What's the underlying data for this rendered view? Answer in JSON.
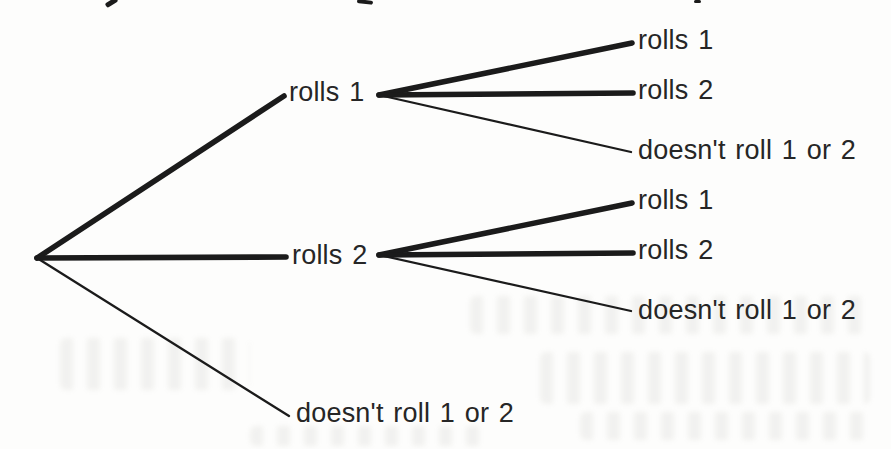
{
  "page": {
    "width": 891,
    "height": 449,
    "background": "#fdfdfc",
    "kind": "scanned textbook probability tree diagram"
  },
  "diagram": {
    "type": "tree",
    "line_color": "#1b1b1b",
    "text_color": "#262626",
    "thick_width": 5.6,
    "thin_width": 2.3,
    "root": {
      "x": 37,
      "y": 258
    },
    "stage1_outcomes": [
      "rolls 1",
      "rolls 2",
      "doesn't roll 1 or 2"
    ],
    "stage2_outcomes": [
      "rolls 1",
      "rolls 2",
      "doesn't roll 1 or 2"
    ],
    "labels": [
      {
        "text": "rolls 1",
        "x": 289,
        "y": 94
      },
      {
        "text": "rolls 2",
        "x": 292,
        "y": 257
      },
      {
        "text": "doesn't roll 1 or 2",
        "x": 296,
        "y": 415
      },
      {
        "text": "rolls 1",
        "x": 638,
        "y": 42
      },
      {
        "text": "rolls 2",
        "x": 638,
        "y": 92
      },
      {
        "text": "doesn't roll 1 or 2",
        "x": 638,
        "y": 152
      },
      {
        "text": "rolls 1",
        "x": 638,
        "y": 202
      },
      {
        "text": "rolls 2",
        "x": 638,
        "y": 252
      },
      {
        "text": "doesn't roll 1 or 2",
        "x": 638,
        "y": 312
      }
    ],
    "branches": [
      {
        "x1": 37,
        "y1": 258,
        "x2": 284,
        "y2": 96,
        "thick": true
      },
      {
        "x1": 37,
        "y1": 258,
        "x2": 286,
        "y2": 257,
        "thick": true
      },
      {
        "x1": 37,
        "y1": 258,
        "x2": 289,
        "y2": 416,
        "thick": false
      },
      {
        "x1": 379,
        "y1": 95,
        "x2": 632,
        "y2": 43,
        "thick": true
      },
      {
        "x1": 379,
        "y1": 95,
        "x2": 633,
        "y2": 93,
        "thick": true
      },
      {
        "x1": 379,
        "y1": 95,
        "x2": 631,
        "y2": 152,
        "thick": false
      },
      {
        "x1": 379,
        "y1": 255,
        "x2": 632,
        "y2": 203,
        "thick": true
      },
      {
        "x1": 379,
        "y1": 255,
        "x2": 633,
        "y2": 253,
        "thick": true
      },
      {
        "x1": 379,
        "y1": 255,
        "x2": 631,
        "y2": 311,
        "thick": false
      }
    ]
  },
  "scan_noise": {
    "crop_artifacts": [
      {
        "x": 105,
        "y": 0,
        "w": 13,
        "h": 5,
        "rotate": -32
      },
      {
        "x": 357,
        "y": 0,
        "w": 16,
        "h": 4,
        "rotate": 6
      },
      {
        "x": 694,
        "y": 0,
        "w": 7,
        "h": 3,
        "rotate": 0
      }
    ],
    "bleedthrough_smudges": [
      {
        "x": 60,
        "y": 338,
        "w": 190,
        "h": 52
      },
      {
        "x": 470,
        "y": 296,
        "w": 400,
        "h": 38
      },
      {
        "x": 540,
        "y": 352,
        "w": 330,
        "h": 52
      },
      {
        "x": 580,
        "y": 412,
        "w": 290,
        "h": 28
      },
      {
        "x": 250,
        "y": 426,
        "w": 240,
        "h": 20
      }
    ]
  }
}
